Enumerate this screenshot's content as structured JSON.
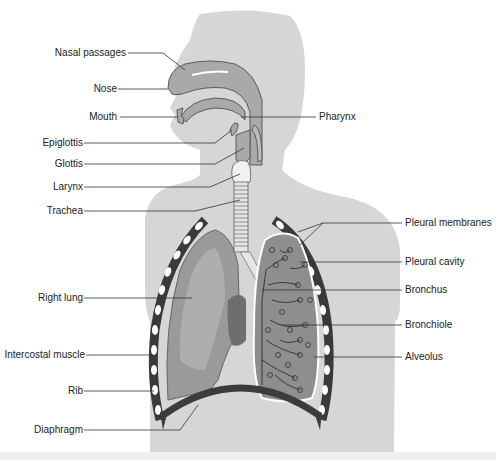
{
  "diagram": {
    "colors": {
      "body": "#d6d6d6",
      "airway": "#a9a9a9",
      "airway_outline": "#5a5a5a",
      "lung_right": "#9a9a9a",
      "lung_left": "#8e8e8e",
      "intercostal_muscle": "#3a3a3a",
      "rib": "#ffffff",
      "diaphragm": "#3c3c3c",
      "heart": "#6e6e6e",
      "leader_line": "#333333",
      "text": "#222222"
    },
    "labels_left": [
      {
        "id": "nasal-passages",
        "text": "Nasal passages"
      },
      {
        "id": "nose",
        "text": "Nose"
      },
      {
        "id": "mouth",
        "text": "Mouth"
      },
      {
        "id": "epiglottis",
        "text": "Epiglottis"
      },
      {
        "id": "glottis",
        "text": "Glottis"
      },
      {
        "id": "larynx",
        "text": "Larynx"
      },
      {
        "id": "trachea",
        "text": "Trachea"
      },
      {
        "id": "right-lung",
        "text": "Right lung"
      },
      {
        "id": "intercostal-muscle",
        "text": "Intercostal muscle"
      },
      {
        "id": "rib",
        "text": "Rib"
      },
      {
        "id": "diaphragm",
        "text": "Diaphragm"
      }
    ],
    "labels_right": [
      {
        "id": "pharynx",
        "text": "Pharynx"
      },
      {
        "id": "pleural-membranes",
        "text": "Pleural membranes"
      },
      {
        "id": "pleural-cavity",
        "text": "Pleural cavity"
      },
      {
        "id": "bronchus",
        "text": "Bronchus"
      },
      {
        "id": "bronchiole",
        "text": "Bronchiole"
      },
      {
        "id": "alveolus",
        "text": "Alveolus"
      }
    ]
  }
}
